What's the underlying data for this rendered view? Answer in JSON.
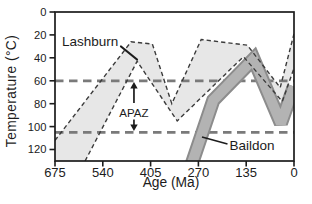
{
  "colors": {
    "ink": "#1c1c1c",
    "lashburn_fill": "#e7e7e7",
    "envelope_outline": "#3b3b3b",
    "baildon_fill": "#b3b3b3",
    "baildon_outline": "#8c8c8c",
    "reference_line": "#7a7a7a",
    "background": "#ffffff"
  },
  "chart_data": {
    "type": "area",
    "point_format": "[age_Ma, temperature_C]",
    "x_axis": {
      "label": "Age (Ma)",
      "range": [
        0,
        675
      ],
      "reversed": true,
      "ticks": [
        675,
        540,
        405,
        270,
        135,
        0
      ]
    },
    "y_axis": {
      "label": "Temperature (°C)",
      "range": [
        0,
        130
      ],
      "inverted": true,
      "ticks": [
        0,
        20,
        40,
        60,
        80,
        100,
        120
      ]
    },
    "reference_lines": [
      {
        "temp": 60,
        "style": "dashed"
      },
      {
        "temp": 105,
        "style": "dashed"
      }
    ],
    "annotation": {
      "label": "APAZ",
      "temp_range": [
        60,
        105
      ],
      "age_position": 452
    },
    "series": [
      {
        "name": "Lashburn",
        "style": "envelope-dashed-outline",
        "points_upper": [
          [
            675,
            112
          ],
          [
            460,
            26
          ],
          [
            400,
            28
          ],
          [
            345,
            80
          ],
          [
            262,
            24
          ],
          [
            132,
            29
          ],
          [
            39,
            66
          ],
          [
            0,
            19
          ]
        ],
        "points_lower": [
          [
            590,
            130
          ],
          [
            443,
            43
          ],
          [
            330,
            95
          ],
          [
            143,
            39
          ],
          [
            33,
            78
          ],
          [
            0,
            49
          ]
        ]
      },
      {
        "name": "Baildon",
        "style": "solid-band",
        "points_center": [
          [
            288,
            132
          ],
          [
            228,
            77
          ],
          [
            114,
            41
          ],
          [
            37,
            97
          ],
          [
            0,
            65
          ]
        ],
        "band_width_degC": 11
      }
    ]
  }
}
